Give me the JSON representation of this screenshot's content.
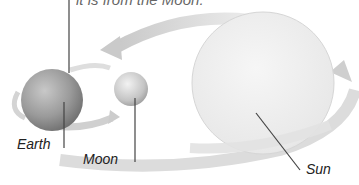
{
  "caption": "it is from the Moon.",
  "bodies": {
    "earth": {
      "label": "Earth",
      "color": "#9a9a9a"
    },
    "moon": {
      "label": "Moon",
      "color": "#c4c4c4"
    },
    "sun": {
      "label": "Sun",
      "color": "#ececec"
    }
  },
  "colors": {
    "leader_line": "#444444",
    "orbit_arrow": "#d2d2d2"
  }
}
